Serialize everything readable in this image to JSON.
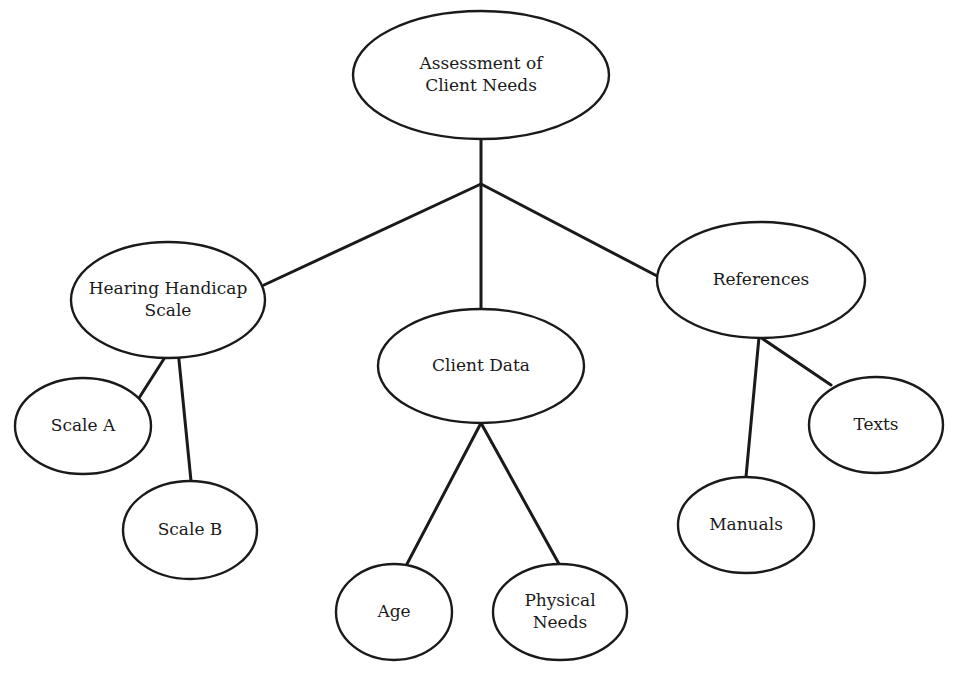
{
  "diagram": {
    "type": "tree",
    "root": "assessment",
    "nodes": [
      {
        "id": "assessment",
        "lines": [
          "Assessment of",
          "Client Needs"
        ],
        "cx": 481,
        "cy": 75,
        "rx": 128,
        "ry": 64
      },
      {
        "id": "hearing",
        "lines": [
          "Hearing Handicap",
          "Scale"
        ],
        "cx": 168,
        "cy": 300,
        "rx": 97,
        "ry": 58
      },
      {
        "id": "client-data",
        "lines": [
          "Client Data"
        ],
        "cx": 481,
        "cy": 366,
        "rx": 103,
        "ry": 57
      },
      {
        "id": "references",
        "lines": [
          "References"
        ],
        "cx": 761,
        "cy": 280,
        "rx": 104,
        "ry": 58
      },
      {
        "id": "scale-a",
        "lines": [
          "Scale A"
        ],
        "cx": 83,
        "cy": 426,
        "rx": 68,
        "ry": 48
      },
      {
        "id": "scale-b",
        "lines": [
          "Scale B"
        ],
        "cx": 190,
        "cy": 530,
        "rx": 67,
        "ry": 49
      },
      {
        "id": "age",
        "lines": [
          "Age"
        ],
        "cx": 394,
        "cy": 612,
        "rx": 58,
        "ry": 48
      },
      {
        "id": "physical",
        "lines": [
          "Physical",
          "Needs"
        ],
        "cx": 560,
        "cy": 612,
        "rx": 67,
        "ry": 48
      },
      {
        "id": "manuals",
        "lines": [
          "Manuals"
        ],
        "cx": 746,
        "cy": 525,
        "rx": 68,
        "ry": 48
      },
      {
        "id": "texts",
        "lines": [
          "Texts"
        ],
        "cx": 876,
        "cy": 425,
        "rx": 67,
        "ry": 48
      }
    ],
    "edges": [
      {
        "from": "assessment",
        "to": "junction",
        "points": [
          [
            481,
            139
          ],
          [
            481,
            184
          ]
        ]
      },
      {
        "from": "junction",
        "to": "hearing",
        "points": [
          [
            481,
            184
          ],
          [
            264,
            285
          ]
        ]
      },
      {
        "from": "junction",
        "to": "client-data",
        "points": [
          [
            481,
            184
          ],
          [
            481,
            309
          ]
        ]
      },
      {
        "from": "junction",
        "to": "references",
        "points": [
          [
            481,
            184
          ],
          [
            659,
            277
          ]
        ]
      },
      {
        "from": "hearing",
        "to": "scale-a",
        "points": [
          [
            176,
            340
          ],
          [
            139,
            398
          ]
        ]
      },
      {
        "from": "hearing",
        "to": "scale-b",
        "points": [
          [
            177,
            340
          ],
          [
            191,
            481
          ]
        ]
      },
      {
        "from": "client-data",
        "to": "age",
        "points": [
          [
            481,
            423
          ],
          [
            407,
            564
          ]
        ]
      },
      {
        "from": "client-data",
        "to": "physical",
        "points": [
          [
            481,
            423
          ],
          [
            559,
            564
          ]
        ]
      },
      {
        "from": "references",
        "to": "manuals",
        "points": [
          [
            759,
            337
          ],
          [
            746,
            477
          ]
        ]
      },
      {
        "from": "references",
        "to": "texts",
        "points": [
          [
            760,
            337
          ],
          [
            831,
            385
          ]
        ]
      }
    ]
  }
}
